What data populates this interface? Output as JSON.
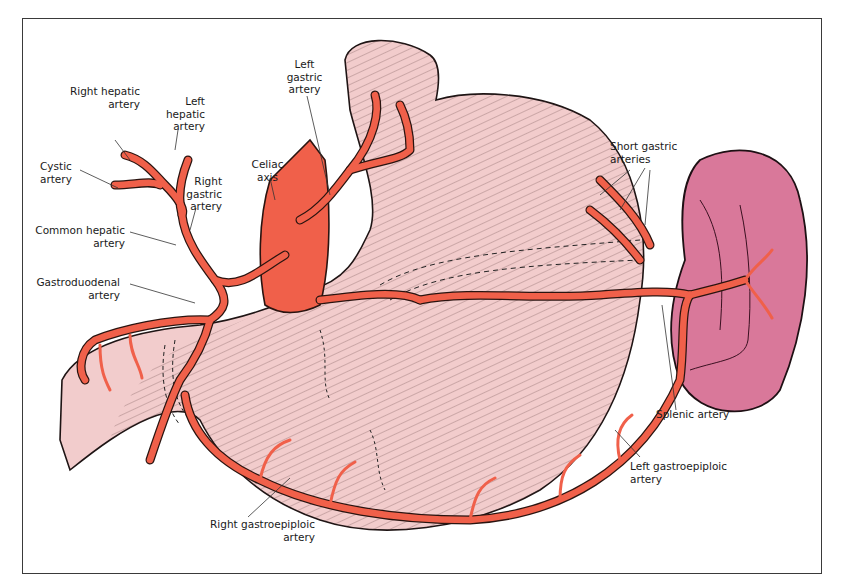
{
  "diagram": {
    "type": "anatomical-illustration",
    "colors": {
      "artery": "#f0604a",
      "artery_outline": "#2a1410",
      "stomach": "#f2cccc",
      "stomach_hatch": "#3a2a2a",
      "spleen": "#d9789a",
      "aorta": "#f0604a",
      "frame": "#3a3a3a",
      "label_text": "#1a1a1a",
      "leader_line": "#333333"
    },
    "labels": {
      "right_hepatic": "Right hepatic\nartery",
      "left_hepatic": "Left\nhepatic\nartery",
      "cystic": "Cystic\nartery",
      "right_gastric": "Right\ngastric\nartery",
      "common_hepatic": "Common hepatic\nartery",
      "gastroduodenal": "Gastroduodenal\nartery",
      "celiac": "Celiac\naxis",
      "left_gastric": "Left\ngastric\nartery",
      "short_gastric": "Short gastric\narteries",
      "splenic": "Splenic artery",
      "left_gastroepiploic": "Left gastroepiploic\nartery",
      "right_gastroepiploic": "Right gastroepiploic\nartery"
    }
  }
}
